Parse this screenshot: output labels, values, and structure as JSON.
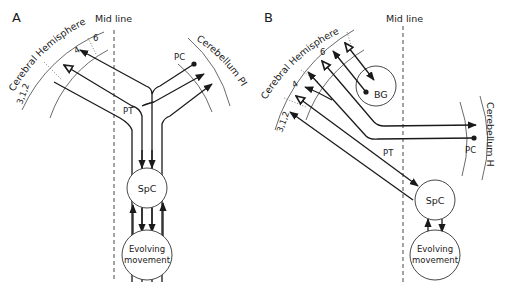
{
  "panels": {
    "A": {
      "letter": "A",
      "midline": "Mid line",
      "cerebral": "Cerebral Hemisphere",
      "cerebellum": "Cerebellum PI",
      "area_6": "6",
      "area_4": "4",
      "area_312": "3,1,2",
      "pc": "PC",
      "pt": "PT",
      "spc": "SpC",
      "evolving_line1": "Evolving",
      "evolving_line2": "movement"
    },
    "B": {
      "letter": "B",
      "midline": "Mid line",
      "cerebral": "Cerebral Hemisphere",
      "cerebellum": "Cerebellum H",
      "area_6": "6",
      "area_4": "4",
      "area_312": "3,1,2",
      "bg": "BG",
      "pc": "PC",
      "pt": "PT",
      "spc": "SpC",
      "evolving_line1": "Evolving",
      "evolving_line2": "movement"
    }
  }
}
